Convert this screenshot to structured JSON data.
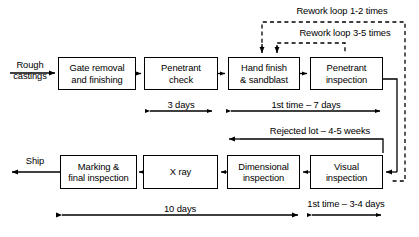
{
  "diagram": {
    "stroke_color": "#000000",
    "background_color": "#ffffff",
    "nodes": [
      {
        "id": "gate-removal",
        "label": "Gate removal\nand finishing",
        "x": 58,
        "y": 57,
        "w": 78,
        "h": 33
      },
      {
        "id": "penetrant-check",
        "label": "Penetrant\ncheck",
        "x": 144,
        "y": 57,
        "w": 74,
        "h": 33
      },
      {
        "id": "hand-finish",
        "label": "Hand finish\n& sandblast",
        "x": 228,
        "y": 57,
        "w": 72,
        "h": 33
      },
      {
        "id": "penetrant-inspect",
        "label": "Penetrant\ninspection",
        "x": 310,
        "y": 57,
        "w": 73,
        "h": 33
      },
      {
        "id": "marking-final",
        "label": "Marking &\nfinal inspection",
        "x": 60,
        "y": 155,
        "w": 77,
        "h": 34
      },
      {
        "id": "x-ray",
        "label": "X ray",
        "x": 143,
        "y": 155,
        "w": 75,
        "h": 34
      },
      {
        "id": "dimensional",
        "label": "Dimensional\ninspection",
        "x": 227,
        "y": 155,
        "w": 73,
        "h": 34
      },
      {
        "id": "visual",
        "label": "Visual\ninspection",
        "x": 310,
        "y": 155,
        "w": 73,
        "h": 34
      }
    ],
    "edge_labels": [
      {
        "id": "rough-castings",
        "text": "Rough\ncastings",
        "x": 8,
        "y": 59,
        "w": 44
      },
      {
        "id": "ship",
        "text": "Ship",
        "x": 18,
        "y": 155,
        "w": 34
      },
      {
        "id": "rework-loop-outer",
        "text": "Rework loop 1-2 times",
        "x": 277,
        "y": 5,
        "w": 130
      },
      {
        "id": "rework-loop-inner",
        "text": "Rework loop 3-5 times",
        "x": 280,
        "y": 27,
        "w": 130
      },
      {
        "id": "rejected-lot",
        "text": "Rejected lot – 4-5 weeks",
        "x": 248,
        "y": 125,
        "w": 140
      },
      {
        "id": "three-days",
        "text": "3 days",
        "x": 158,
        "y": 98,
        "w": 46
      },
      {
        "id": "first-time-7-days",
        "text": "1st time – 7 days",
        "x": 258,
        "y": 98,
        "w": 96
      },
      {
        "id": "ten-days",
        "text": "10 days",
        "x": 155,
        "y": 205,
        "w": 50
      },
      {
        "id": "first-time-3-4-days",
        "text": "1st time – 3-4 days",
        "x": 296,
        "y": 198,
        "w": 100
      }
    ]
  }
}
